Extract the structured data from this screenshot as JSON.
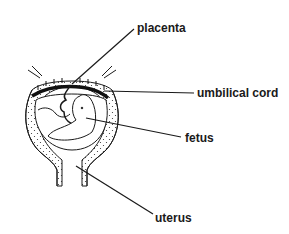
{
  "diagram": {
    "type": "labeled-illustration",
    "labels": [
      {
        "id": "placenta",
        "text": "placenta"
      },
      {
        "id": "umbilical-cord",
        "text": "umbilical cord"
      },
      {
        "id": "fetus",
        "text": "fetus"
      },
      {
        "id": "uterus",
        "text": "uterus"
      }
    ],
    "colors": {
      "ink": "#1a1a1a",
      "background": "#ffffff"
    }
  }
}
